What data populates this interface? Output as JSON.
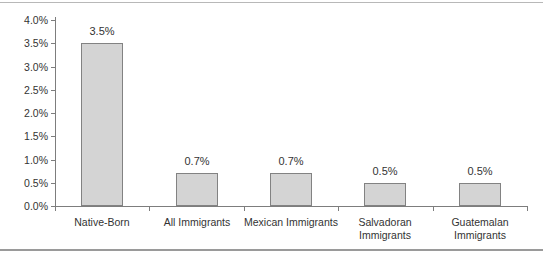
{
  "chart_data": {
    "type": "bar",
    "categories": [
      "Native-Born",
      "All Immigrants",
      "Mexican Immigrants",
      "Salvadoran\nImmigrants",
      "Guatemalan\nImmigrants"
    ],
    "values": [
      3.5,
      0.7,
      0.7,
      0.5,
      0.5
    ],
    "value_labels": [
      "3.5%",
      "0.7%",
      "0.7%",
      "0.5%",
      "0.5%"
    ],
    "title": "",
    "xlabel": "",
    "ylabel": "",
    "ylim": [
      0.0,
      4.0
    ],
    "y_tick_step": 0.5,
    "y_tick_labels": [
      "0.0%",
      "0.5%",
      "1.0%",
      "1.5%",
      "2.0%",
      "2.5%",
      "3.0%",
      "3.5%",
      "4.0%"
    ],
    "grid": "off",
    "legend": "none",
    "colors": {
      "bar_fill": "#d4d4d4",
      "bar_border": "#828282",
      "axis": "#7d7d7d",
      "text": "#333333",
      "top_rule": "#b8b8b8",
      "bottom_rule": "#9a9a9a",
      "background": "#ffffff"
    }
  }
}
